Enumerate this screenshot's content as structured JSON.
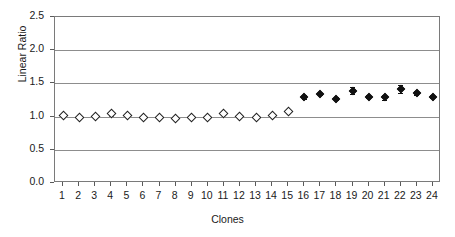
{
  "chart_data": {
    "type": "scatter",
    "title": "",
    "xlabel": "Clones",
    "ylabel": "Linear Ratio",
    "xlim": [
      0.5,
      24.5
    ],
    "ylim": [
      0.0,
      2.5
    ],
    "ytick_labels": [
      "0.0",
      "0.5",
      "1.0",
      "1.5",
      "2.0",
      "2.5"
    ],
    "ytick_values": [
      0.0,
      0.5,
      1.0,
      1.5,
      2.0,
      2.5
    ],
    "xtick_labels": [
      "1",
      "2",
      "3",
      "4",
      "5",
      "6",
      "7",
      "8",
      "9",
      "10",
      "11",
      "12",
      "13",
      "14",
      "15",
      "16",
      "17",
      "18",
      "19",
      "20",
      "21",
      "22",
      "23",
      "24"
    ],
    "grid": true,
    "legend": "none",
    "series": [
      {
        "name": "open-diamond-clones",
        "marker": "open-diamond",
        "x": [
          1,
          2,
          3,
          4,
          5,
          6,
          7,
          8,
          9,
          10,
          11,
          12,
          13,
          14,
          15
        ],
        "values": [
          1.02,
          0.98,
          1.0,
          1.05,
          1.01,
          0.99,
          0.99,
          0.97,
          0.98,
          0.99,
          1.05,
          1.0,
          0.99,
          1.02,
          1.08
        ],
        "errors": [
          0.0,
          0.0,
          0.0,
          0.04,
          0.0,
          0.0,
          0.0,
          0.0,
          0.0,
          0.0,
          0.03,
          0.0,
          0.02,
          0.02,
          0.0
        ]
      },
      {
        "name": "filled-diamond-clones",
        "marker": "filled-diamond",
        "x": [
          16,
          17,
          18,
          19,
          20,
          21,
          22,
          23,
          24
        ],
        "values": [
          1.3,
          1.34,
          1.27,
          1.39,
          1.3,
          1.29,
          1.41,
          1.35,
          1.3
        ],
        "errors": [
          0.03,
          0.02,
          0.02,
          0.05,
          0.02,
          0.04,
          0.06,
          0.03,
          0.02
        ]
      }
    ]
  }
}
